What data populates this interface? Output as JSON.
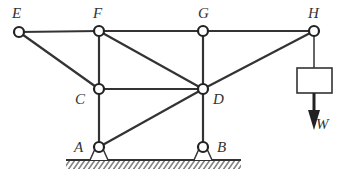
{
  "diagram": {
    "type": "truss",
    "nodes": [
      {
        "id": "E",
        "label": "E",
        "x": 19,
        "y": 32,
        "lx": 12,
        "ly": 18
      },
      {
        "id": "F",
        "label": "F",
        "x": 99,
        "y": 31,
        "lx": 93,
        "ly": 18
      },
      {
        "id": "G",
        "label": "G",
        "x": 203,
        "y": 31,
        "lx": 198,
        "ly": 18
      },
      {
        "id": "H",
        "label": "H",
        "x": 314,
        "y": 31,
        "lx": 308,
        "ly": 18
      },
      {
        "id": "C",
        "label": "C",
        "x": 99,
        "y": 89,
        "lx": 75,
        "ly": 104
      },
      {
        "id": "D",
        "label": "D",
        "x": 203,
        "y": 89,
        "lx": 213,
        "ly": 104
      },
      {
        "id": "A",
        "label": "A",
        "x": 99,
        "y": 147,
        "lx": 74,
        "ly": 152
      },
      {
        "id": "B",
        "label": "B",
        "x": 203,
        "y": 147,
        "lx": 217,
        "ly": 152
      }
    ],
    "members": [
      [
        "E",
        "F"
      ],
      [
        "F",
        "G"
      ],
      [
        "G",
        "H"
      ],
      [
        "E",
        "C"
      ],
      [
        "F",
        "C"
      ],
      [
        "C",
        "A"
      ],
      [
        "F",
        "D"
      ],
      [
        "C",
        "D"
      ],
      [
        "G",
        "D"
      ],
      [
        "D",
        "B"
      ],
      [
        "A",
        "D"
      ],
      [
        "H",
        "D"
      ]
    ],
    "supports": [
      "A",
      "B"
    ],
    "load": {
      "label": "W",
      "attached_to": "H",
      "direction": "down"
    }
  }
}
